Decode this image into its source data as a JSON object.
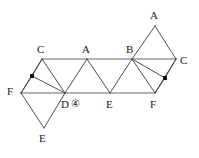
{
  "figure": {
    "width": 199,
    "height": 158,
    "stroke_color": "#3a3a3a",
    "rail_color": "#9a9a9a",
    "marker_color": "#111111",
    "background": "#ffffff",
    "top_rail": {
      "x1": 42,
      "y1": 59,
      "x2": 176,
      "y2": 59
    },
    "bottom_rail": {
      "x1": 21,
      "y1": 93,
      "x2": 155,
      "y2": 93
    },
    "points": {
      "C_left": {
        "x": 42,
        "y": 59
      },
      "A_top": {
        "x": 87,
        "y": 59
      },
      "B_top": {
        "x": 132,
        "y": 59
      },
      "C_right": {
        "x": 176,
        "y": 59
      },
      "A_apex": {
        "x": 155,
        "y": 26
      },
      "F_left": {
        "x": 21,
        "y": 93
      },
      "D_bottom": {
        "x": 65,
        "y": 93
      },
      "E_bottom": {
        "x": 110,
        "y": 93
      },
      "F_right": {
        "x": 155,
        "y": 93
      },
      "E_apex": {
        "x": 44,
        "y": 128
      },
      "dot_left": {
        "x": 32,
        "y": 76
      },
      "dot_right": {
        "x": 165,
        "y": 78
      }
    },
    "labels": [
      {
        "name": "label-c-left",
        "text": "C",
        "x": 37,
        "y": 44
      },
      {
        "name": "label-a-top",
        "text": "A",
        "x": 82,
        "y": 44
      },
      {
        "name": "label-b-top",
        "text": "B",
        "x": 126,
        "y": 44
      },
      {
        "name": "label-c-right",
        "text": "C",
        "x": 180,
        "y": 55
      },
      {
        "name": "label-a-apex",
        "text": "A",
        "x": 150,
        "y": 10
      },
      {
        "name": "label-f-left",
        "text": "F",
        "x": 7,
        "y": 86
      },
      {
        "name": "label-d-bottom",
        "text": "D",
        "x": 61,
        "y": 99
      },
      {
        "name": "label-e-bottom",
        "text": "E",
        "x": 106,
        "y": 99
      },
      {
        "name": "label-f-right",
        "text": "F",
        "x": 150,
        "y": 99
      },
      {
        "name": "label-e-apex",
        "text": "E",
        "x": 39,
        "y": 133
      }
    ],
    "annotation": {
      "name": "circled-four",
      "text": "④",
      "value": "4",
      "x": 71,
      "y": 99
    },
    "edges": [
      {
        "name": "edge-cleft-dbottom",
        "x1": 42,
        "y1": 59,
        "x2": 65,
        "y2": 93
      },
      {
        "name": "edge-dbottom-atop",
        "x1": 65,
        "y1": 93,
        "x2": 87,
        "y2": 59
      },
      {
        "name": "edge-atop-ebottom",
        "x1": 87,
        "y1": 59,
        "x2": 110,
        "y2": 93
      },
      {
        "name": "edge-ebottom-btop",
        "x1": 110,
        "y1": 93,
        "x2": 132,
        "y2": 59
      },
      {
        "name": "edge-btop-fright",
        "x1": 132,
        "y1": 59,
        "x2": 155,
        "y2": 93
      },
      {
        "name": "edge-fright-cright",
        "x1": 155,
        "y1": 93,
        "x2": 176,
        "y2": 59
      },
      {
        "name": "edge-btop-aapex",
        "x1": 132,
        "y1": 59,
        "x2": 155,
        "y2": 26
      },
      {
        "name": "edge-aapex-cright",
        "x1": 155,
        "y1": 26,
        "x2": 176,
        "y2": 59
      },
      {
        "name": "edge-fleft-cleft",
        "x1": 21,
        "y1": 93,
        "x2": 42,
        "y2": 59
      },
      {
        "name": "edge-fleft-eapex",
        "x1": 21,
        "y1": 93,
        "x2": 44,
        "y2": 128
      },
      {
        "name": "edge-eapex-dbottom",
        "x1": 44,
        "y1": 128,
        "x2": 65,
        "y2": 93
      },
      {
        "name": "edge-dbottom-dotleft",
        "x1": 65,
        "y1": 93,
        "x2": 32,
        "y2": 76
      },
      {
        "name": "edge-dotleft-cleft",
        "x1": 32,
        "y1": 76,
        "x2": 42,
        "y2": 59
      },
      {
        "name": "edge-dotleft-fleft",
        "x1": 32,
        "y1": 76,
        "x2": 21,
        "y2": 93
      },
      {
        "name": "edge-btop-dotright",
        "x1": 132,
        "y1": 59,
        "x2": 165,
        "y2": 78
      },
      {
        "name": "edge-dotright-cright",
        "x1": 165,
        "y1": 78,
        "x2": 176,
        "y2": 59
      },
      {
        "name": "edge-dotright-fright",
        "x1": 165,
        "y1": 78,
        "x2": 155,
        "y2": 93
      }
    ],
    "markers": [
      {
        "name": "marker-dot-left",
        "x": 32,
        "y": 76,
        "size": 4
      },
      {
        "name": "marker-dot-right",
        "x": 165,
        "y": 78,
        "size": 4
      }
    ]
  }
}
